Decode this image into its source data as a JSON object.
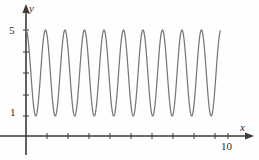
{
  "figure": {
    "name": "oscillating-sinusoid-plot",
    "background": "#fefefe",
    "curve_color": "#77777a",
    "axis_color": "#3a3a3a"
  },
  "axes": {
    "y_axis_label": "y",
    "x_axis_label": "x",
    "y_ticks": [
      {
        "value": 1,
        "label": "1",
        "py": 116
      },
      {
        "value": 5,
        "label": "5",
        "py": 30
      }
    ],
    "x_ticks": [
      {
        "value": 1,
        "label": "",
        "px": 47
      },
      {
        "value": 2,
        "label": "",
        "px": 68
      },
      {
        "value": 3,
        "label": "",
        "px": 89
      },
      {
        "value": 4,
        "label": "",
        "px": 110
      },
      {
        "value": 5,
        "label": "",
        "px": 131
      },
      {
        "value": 6,
        "label": "",
        "px": 152
      },
      {
        "value": 7,
        "label": "",
        "px": 173
      },
      {
        "value": 8,
        "label": "",
        "px": 194
      },
      {
        "value": 9,
        "label": "",
        "px": 215
      },
      {
        "value": 10,
        "label": "10",
        "px": 228
      }
    ],
    "x_axis_pixel_y": 136,
    "y_axis_pixel_x": 26,
    "x_arrow_tip_px": 254,
    "y_arrow_tip_py": 4,
    "y_axis_bottom_py": 155
  },
  "chart_data": {
    "type": "line",
    "title": "",
    "subtitle": "",
    "xlabel": "x",
    "ylabel": "y",
    "grid": false,
    "legend": null,
    "annotations": [],
    "xlim": [
      0,
      10.7
    ],
    "ylim": [
      0,
      5.6
    ],
    "xtick_labels": [
      "10"
    ],
    "ytick_labels": [
      "1",
      "5"
    ],
    "series": [
      {
        "name": "y = 3 + 2*cos(2*pi*x/0.965)",
        "color": "#77777a",
        "amplitude": 2,
        "midline": 3,
        "ymin": 1,
        "ymax": 5,
        "period": 0.965,
        "peak_count": 10,
        "x_start": 0,
        "x_end": 9.62,
        "starts_at": [
          0,
          5
        ],
        "ends_at": [
          9.62,
          4.8
        ]
      }
    ]
  }
}
